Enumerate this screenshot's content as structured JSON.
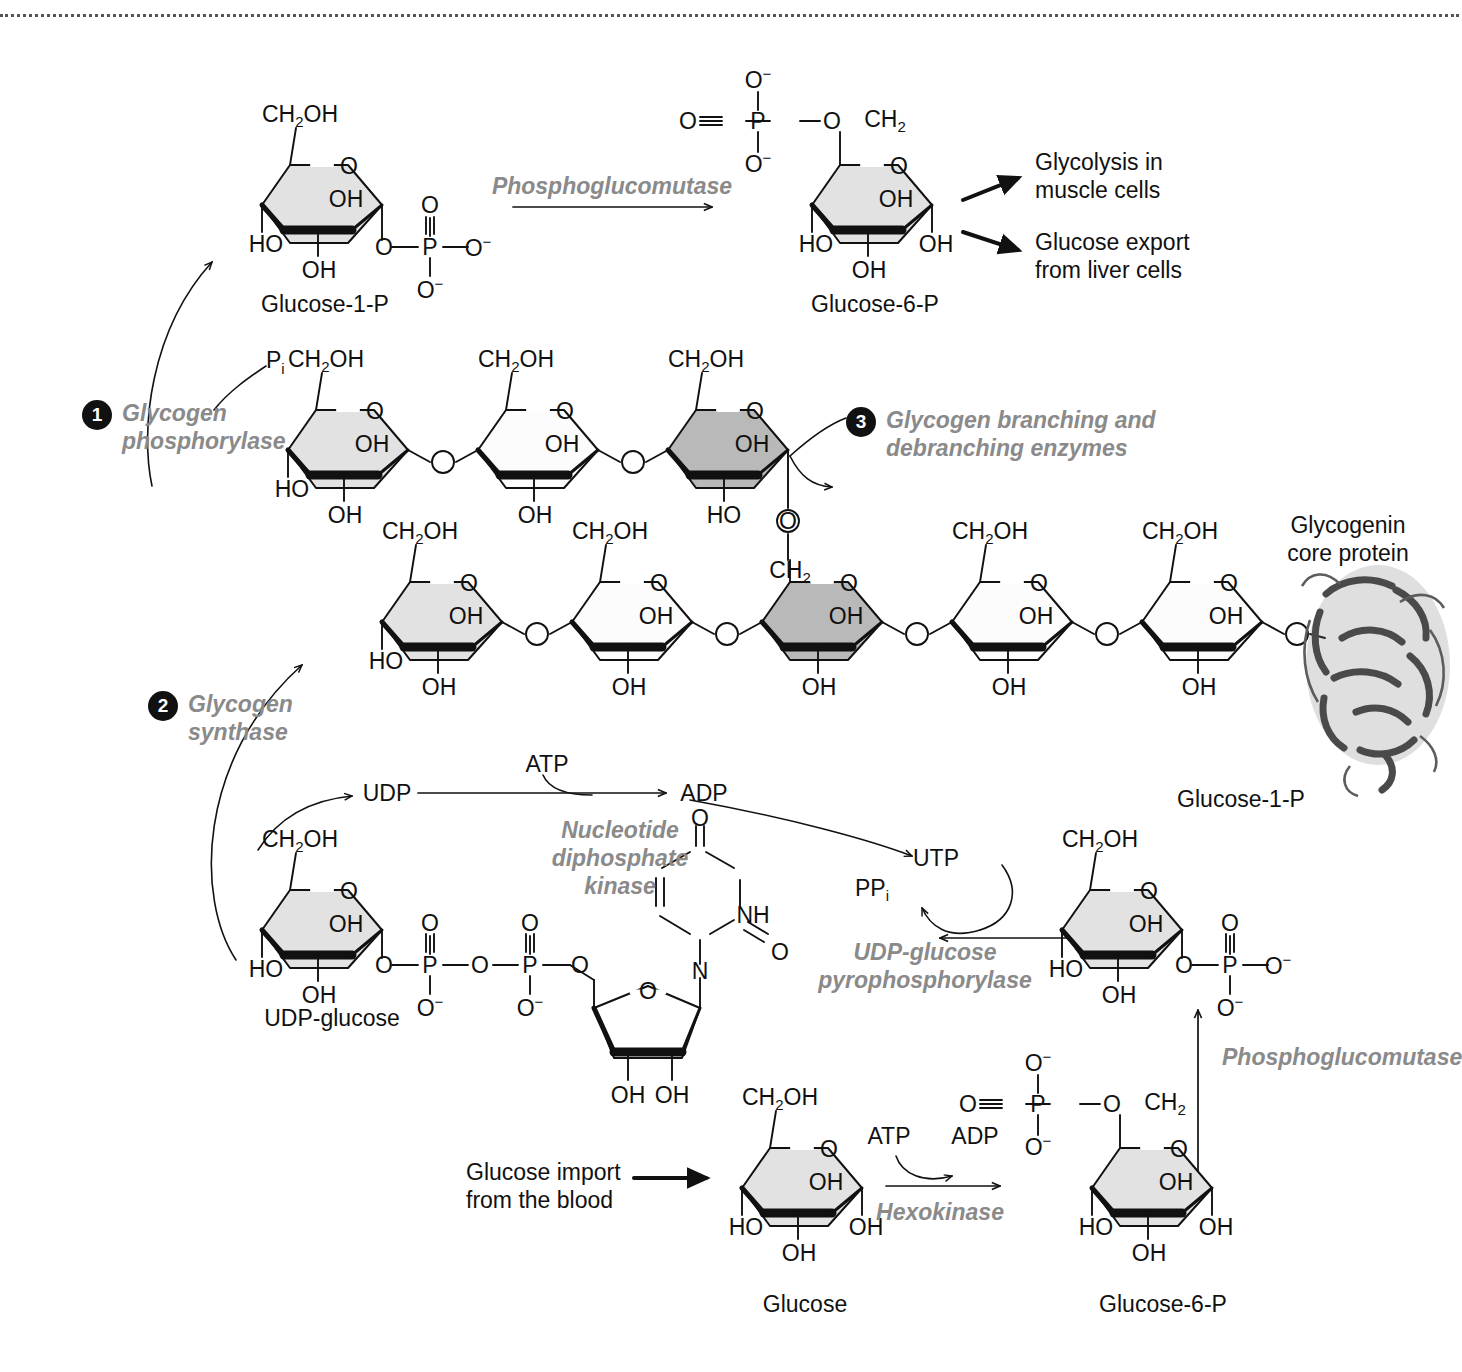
{
  "figure": {
    "border": "dotted-top"
  },
  "colors": {
    "ring_light": "#e2e2e2",
    "ring_dark": "#b9b9b9",
    "enzyme_gray": "#8a8a8a",
    "stroke": "#111111",
    "protein": "#4a4a4a"
  },
  "steps": [
    {
      "number": "1",
      "label_line1": "Glycogen",
      "label_line2": "phosphorylase"
    },
    {
      "number": "2",
      "label_line1": "Glycogen",
      "label_line2": "synthase"
    },
    {
      "number": "3",
      "label_line1": "Glycogen branching and",
      "label_line2": "debranching enzymes"
    }
  ],
  "enzymes": {
    "phosphoglucomutase_top": "Phosphoglucomutase",
    "phosphoglucomutase_bottom": "Phosphoglucomutase",
    "hexokinase": "Hexokinase",
    "ndp_kinase_l1": "Nucleotide",
    "ndp_kinase_l2": "diphosphate",
    "ndp_kinase_l3": "kinase",
    "udpg_pyrophosphorylase_l1": "UDP-glucose",
    "udpg_pyrophosphorylase_l2": "pyrophosphorylase"
  },
  "molecule_labels": {
    "glucose_1p_top": "Glucose-1-P",
    "glucose_6p_top": "Glucose-6-P",
    "glucose_1p_right": "Glucose-1-P",
    "udp_glucose": "UDP-glucose",
    "glucose": "Glucose",
    "glucose_6p_bottom": "Glucose-6-P",
    "glycogenin_l1": "Glycogenin",
    "glycogenin_l2": "core protein"
  },
  "fate_arrows": [
    {
      "line1": "Glycolysis in",
      "line2": "muscle cells"
    },
    {
      "line1": "Glucose export",
      "line2": "from liver cells"
    }
  ],
  "inputs": {
    "glucose_import_l1": "Glucose import",
    "glucose_import_l2": "from the blood"
  },
  "small_molecules": {
    "pi": "P",
    "pi_sub": "i",
    "udp": "UDP",
    "atp_top": "ATP",
    "adp_top": "ADP",
    "utp": "UTP",
    "ppi": "PP",
    "ppi_sub": "i",
    "atp_bottom": "ATP",
    "adp_bottom": "ADP"
  },
  "atoms": {
    "ch2oh": "CH",
    "ch2oh_sub": "2",
    "ch2oh_tail": "OH",
    "ch2": "CH",
    "ch2_sub": "2",
    "oh": "OH",
    "ho": "HO",
    "o": "O",
    "p": "P",
    "n": "N",
    "nh": "NH",
    "minus": "−"
  }
}
